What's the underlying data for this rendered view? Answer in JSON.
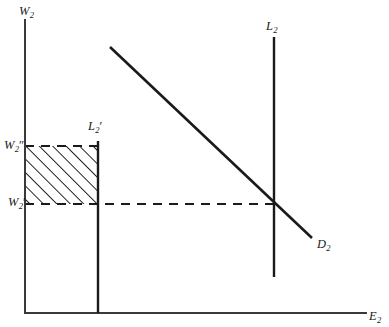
{
  "figure": {
    "background_color": "#ffffff",
    "line_color": "#1a1a1a",
    "axis_color": "#3a3a3a"
  },
  "axes": {
    "y_axis": {
      "label_base": "W",
      "label_sub": "2",
      "name": "vertical-wage-axis",
      "x": 25,
      "y_top": 20,
      "y_bottom": 313
    },
    "x_axis": {
      "label_base": "E",
      "label_sub": "2",
      "name": "horizontal-employment-axis",
      "y": 313,
      "x_left": 25,
      "x_right": 366
    }
  },
  "wage_levels": [
    {
      "id": "w2-double-prime",
      "label_base": "W",
      "label_sub": "2",
      "label_prime": "″",
      "y": 146,
      "description": "upper wage level, top edge of hatched rectangle"
    },
    {
      "id": "w2-prime",
      "label_base": "W",
      "label_sub": "2",
      "label_prime": "′",
      "y": 204,
      "description": "lower wage level, bottom edge of hatched rectangle and dashed equilibrium line"
    }
  ],
  "curves": [
    {
      "id": "labor-supply-restricted",
      "label_base": "L",
      "label_sub": "2",
      "label_prime": "′",
      "type": "vertical-supply",
      "x": 98,
      "y_top": 141,
      "y_bottom": 313
    },
    {
      "id": "labor-supply",
      "label_base": "L",
      "label_sub": "2",
      "label_prime": "",
      "type": "vertical-supply",
      "x": 274,
      "y_top": 37,
      "y_bottom": 277
    },
    {
      "id": "labor-demand",
      "label_base": "D",
      "label_sub": "2",
      "label_prime": "",
      "type": "downward-sloping-demand",
      "x1": 110,
      "y1": 47,
      "x2": 312,
      "y2": 238
    }
  ],
  "shaded_area": {
    "id": "hatched-rectangle",
    "description": "hatched rectangle between W2' and W2'' from vertical axis to L2'",
    "x_left": 25,
    "x_right": 98,
    "y_top": 146,
    "y_bottom": 204,
    "hatch_angle_degrees": 45,
    "hatch_spacing": 9.5,
    "border_style": "dashed"
  },
  "dashed_lines": [
    {
      "id": "equilibrium-wage-dashed",
      "description": "horizontal dashed line at W2' from axis to L2 / D2 intersection",
      "x1": 25,
      "x2": 274,
      "y": 204
    }
  ],
  "intersection_point": {
    "id": "equilibrium-point",
    "x": 274,
    "y": 204,
    "description": "intersection of D2, L2 and the W2' dashed line"
  }
}
